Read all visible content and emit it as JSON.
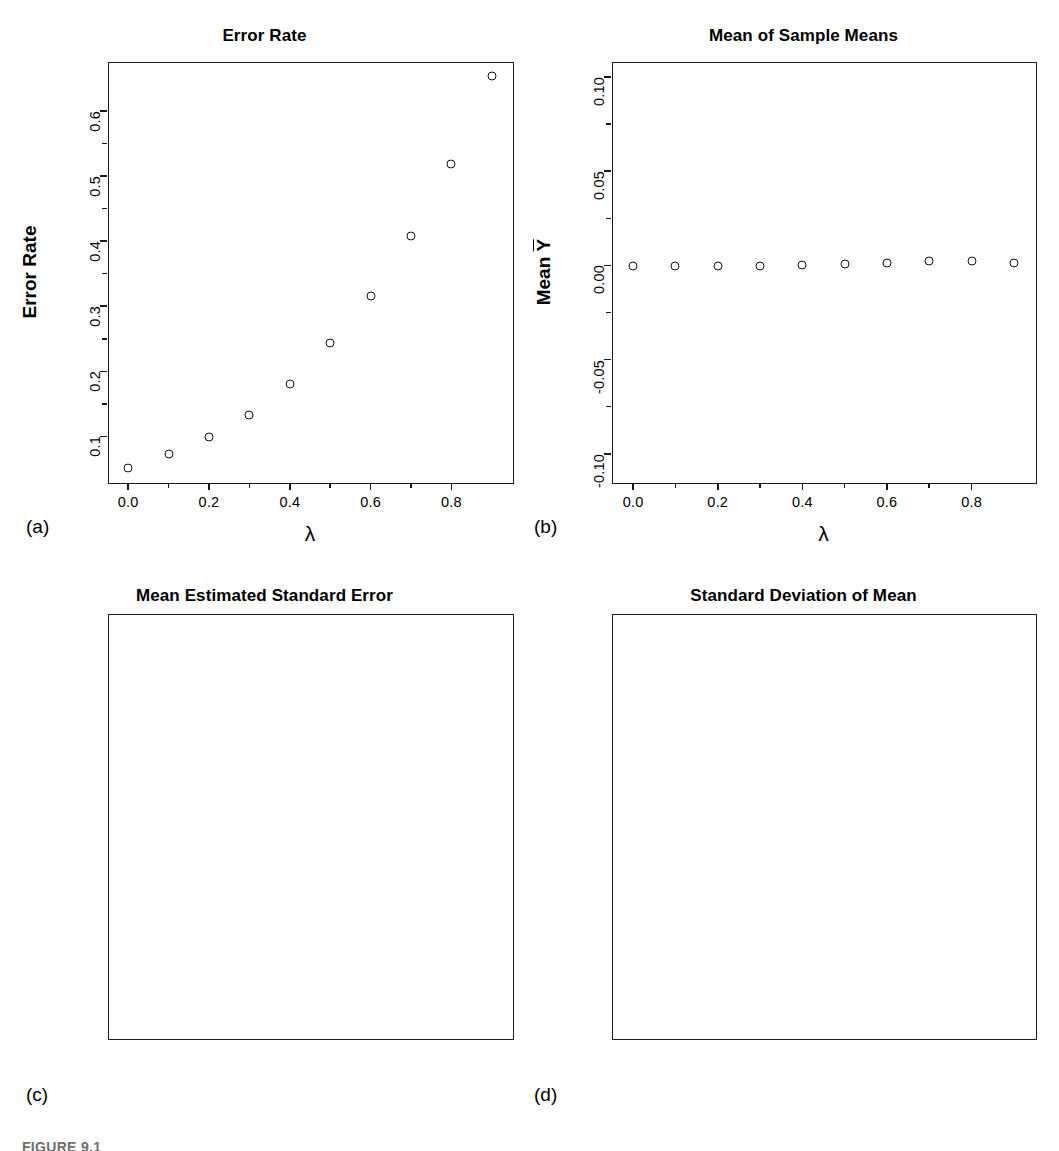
{
  "figure": {
    "caption": "FIGURE 9.1",
    "panel_letters": {
      "a": "(a)",
      "b": "(b)",
      "c": "(c)",
      "d": "(d)"
    },
    "xlabel_symbol": "λ"
  },
  "chart_data": [
    {
      "type": "scatter",
      "panel": "(a)",
      "title": "Error Rate",
      "xlabel": "λ",
      "ylabel": "Error Rate",
      "x": [
        0.0,
        0.1,
        0.2,
        0.3,
        0.4,
        0.5,
        0.6,
        0.7,
        0.8,
        0.9
      ],
      "values": [
        0.051,
        0.073,
        0.099,
        0.133,
        0.181,
        0.243,
        0.315,
        0.408,
        0.519,
        0.653
      ],
      "xlim": [
        -0.05,
        0.95
      ],
      "ylim": [
        0.03,
        0.675
      ],
      "xticks": [
        0.0,
        0.2,
        0.4,
        0.6,
        0.8
      ],
      "xticklabels": [
        "0.0",
        "0.2",
        "0.4",
        "0.6",
        "0.8"
      ],
      "yticks": [
        0.1,
        0.2,
        0.3,
        0.4,
        0.5,
        0.6
      ],
      "yticklabels": [
        "0.1",
        "0.2",
        "0.3",
        "0.4",
        "0.5",
        "0.6"
      ],
      "grid": false,
      "legend": null,
      "marker": "open-circle"
    },
    {
      "type": "scatter",
      "panel": "(b)",
      "title": "Mean of Sample Means",
      "xlabel": "λ",
      "ylabel": "Mean Ȳ",
      "x": [
        0.0,
        0.1,
        0.2,
        0.3,
        0.4,
        0.5,
        0.6,
        0.7,
        0.8,
        0.9
      ],
      "values": [
        -0.0002,
        -0.0002,
        -0.0002,
        -0.0001,
        0.0003,
        0.0008,
        0.0015,
        0.0021,
        0.0026,
        0.0013
      ],
      "xlim": [
        -0.05,
        0.95
      ],
      "ylim": [
        -0.115,
        0.108
      ],
      "xticks": [
        0.0,
        0.2,
        0.4,
        0.6,
        0.8
      ],
      "xticklabels": [
        "0.0",
        "0.2",
        "0.4",
        "0.6",
        "0.8"
      ],
      "yticks": [
        -0.1,
        -0.05,
        0.0,
        0.05,
        0.1
      ],
      "yticklabels": [
        "-0.10",
        "-0.05",
        "0.00",
        "0.05",
        "0.10"
      ],
      "grid": false,
      "legend": null,
      "marker": "open-circle"
    },
    {
      "type": "scatter",
      "panel": "(c)",
      "title": "Mean Estimated Standard Error",
      "xlabel": "λ",
      "ylabel": "Mean s{Ȳ}",
      "x": [
        0.0,
        0.1,
        0.2,
        0.3,
        0.4,
        0.5,
        0.6,
        0.7,
        0.8,
        0.9
      ],
      "values": [
        0.306,
        0.304,
        0.304,
        0.306,
        0.311,
        0.318,
        0.327,
        0.339,
        0.353,
        0.371
      ],
      "xlim": [
        -0.05,
        0.95
      ],
      "ylim": [
        -0.015,
        0.522
      ],
      "xticks": [
        0.0,
        0.2,
        0.4,
        0.6,
        0.8
      ],
      "xticklabels": [
        "0.0",
        "0.2",
        "0.4",
        "0.6",
        "0.8"
      ],
      "yticks": [
        0.0,
        0.1,
        0.2,
        0.3,
        0.4,
        0.5
      ],
      "yticklabels": [
        "0.0",
        "0.1",
        "0.2",
        "0.3",
        "0.4",
        "0.5"
      ],
      "grid": false,
      "legend": null,
      "marker": "open-circle"
    },
    {
      "type": "scatter",
      "panel": "(d)",
      "title": "Standard Deviation of Mean",
      "xlabel": "λ",
      "ylabel": "Std. Dev. of Ȳ",
      "x": [
        0.0,
        0.1,
        0.2,
        0.3,
        0.4,
        0.5,
        0.6,
        0.7,
        0.8,
        0.9
      ],
      "values": [
        0.32,
        0.35,
        0.385,
        0.435,
        0.5,
        0.59,
        0.705,
        0.89,
        1.22,
        1.86
      ],
      "xlim": [
        -0.05,
        0.95
      ],
      "ylim": [
        -0.06,
        2.09
      ],
      "xticks": [
        0.0,
        0.2,
        0.4,
        0.6,
        0.8
      ],
      "xticklabels": [
        "0.0",
        "0.2",
        "0.4",
        "0.6",
        "0.8"
      ],
      "yticks": [
        0.0,
        0.5,
        1.0,
        1.5,
        2.0
      ],
      "yticklabels": [
        "0.0",
        "0.5",
        "1.0",
        "1.5",
        "2.0"
      ],
      "grid": false,
      "legend": null,
      "marker": "open-circle"
    }
  ]
}
